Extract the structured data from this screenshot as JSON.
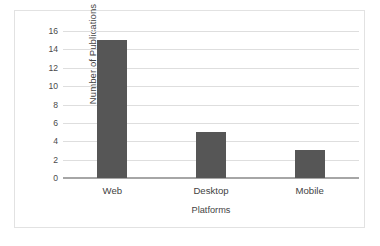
{
  "chart_data": {
    "type": "bar",
    "title": "",
    "categories": [
      "Web",
      "Desktop",
      "Mobile"
    ],
    "values": [
      15,
      5,
      3
    ],
    "series": [
      {
        "name": "Number of Publications",
        "values": [
          15,
          5,
          3
        ]
      }
    ],
    "xlabel": "Platforms",
    "ylabel": "Number of Publications",
    "ylim": [
      0,
      16
    ],
    "ytick_step": 2,
    "yticks": [
      16,
      14,
      12,
      10,
      8,
      6,
      4,
      2,
      0
    ],
    "ytick_labels": [
      "16",
      "14",
      "12",
      "10",
      "8",
      "6",
      "4",
      "2",
      "0"
    ],
    "grid": true,
    "grid_axis": "y",
    "legend": false,
    "legend_position": "none",
    "bar_color": "#565656",
    "gridline_color": "#dedede",
    "axis_line_color": "#a6a6a6",
    "text_color": "#454545",
    "plot_background": "#ffffff",
    "frame_border_color": "#e2e2e2"
  }
}
